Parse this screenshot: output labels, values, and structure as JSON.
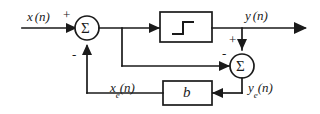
{
  "diagram": {
    "stroke_color": "#1a1a1a",
    "background_color": "#ffffff",
    "signals": {
      "input_label_var": "x",
      "input_label_arg": "(n)",
      "output_label_var": "y",
      "output_label_arg": "(n)",
      "error_out_var": "y",
      "error_out_sub": "e",
      "error_out_arg": "(n)",
      "error_fb_var": "x",
      "error_fb_sub": "e",
      "error_fb_arg": "(n)"
    },
    "blocks": {
      "quantizer_name": "quantizer-block",
      "quantizer_symbol": "staircase",
      "gain_label": "b"
    },
    "summers": {
      "first_symbol": "Σ",
      "first_input_sign": "+",
      "first_feedback_sign": "-",
      "second_symbol": "Σ",
      "second_top_sign": "+",
      "second_left_sign": "-"
    }
  }
}
